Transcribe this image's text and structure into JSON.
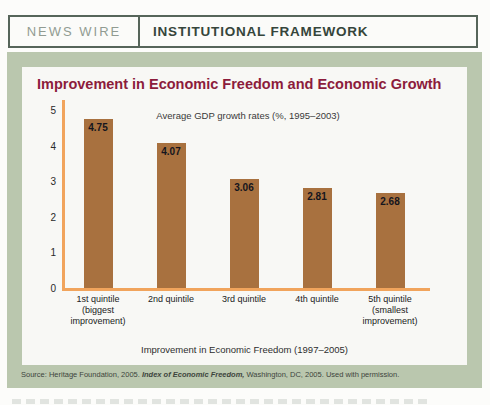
{
  "header": {
    "kicker": "NEWS WIRE",
    "title": "INSTITUTIONAL FRAMEWORK"
  },
  "chart_data": {
    "type": "bar",
    "title": "Improvement in Economic Freedom and Economic Growth",
    "subtitle": "Average GDP growth rates (%, 1995–2003)",
    "categories": [
      [
        "1st quintile",
        "(biggest",
        "improvement)"
      ],
      [
        "2nd quintile"
      ],
      [
        "3rd quintile"
      ],
      [
        "4th quintile"
      ],
      [
        "5th quintile",
        "(smallest",
        "improvement)"
      ]
    ],
    "values": [
      4.75,
      4.07,
      3.06,
      2.81,
      2.68
    ],
    "value_labels": [
      "4.75",
      "4.07",
      "3.06",
      "2.81",
      "2.68"
    ],
    "xlabel": "Improvement in Economic Freedom (1997–2005)",
    "ylabel": "",
    "ylim": [
      0,
      5
    ],
    "yticks": [
      0,
      1,
      2,
      3,
      4,
      5
    ],
    "grid": false,
    "legend": null,
    "bar_color": "#a8713f",
    "axis_color": "#f1a45c",
    "value_label_color": "#15151d",
    "title_color": "#8c1c3c"
  },
  "source": {
    "prefix": "Source: Heritage Foundation, 2005. ",
    "work": "Index of Economic Freedom,",
    "suffix": " Washington, DC, 2005. Used with permission."
  },
  "colors": {
    "band": "#bac7ae",
    "panel": "#f8f8f5",
    "header_border": "#56655a",
    "header_kicker": "#919b92",
    "header_title": "#35453b"
  }
}
